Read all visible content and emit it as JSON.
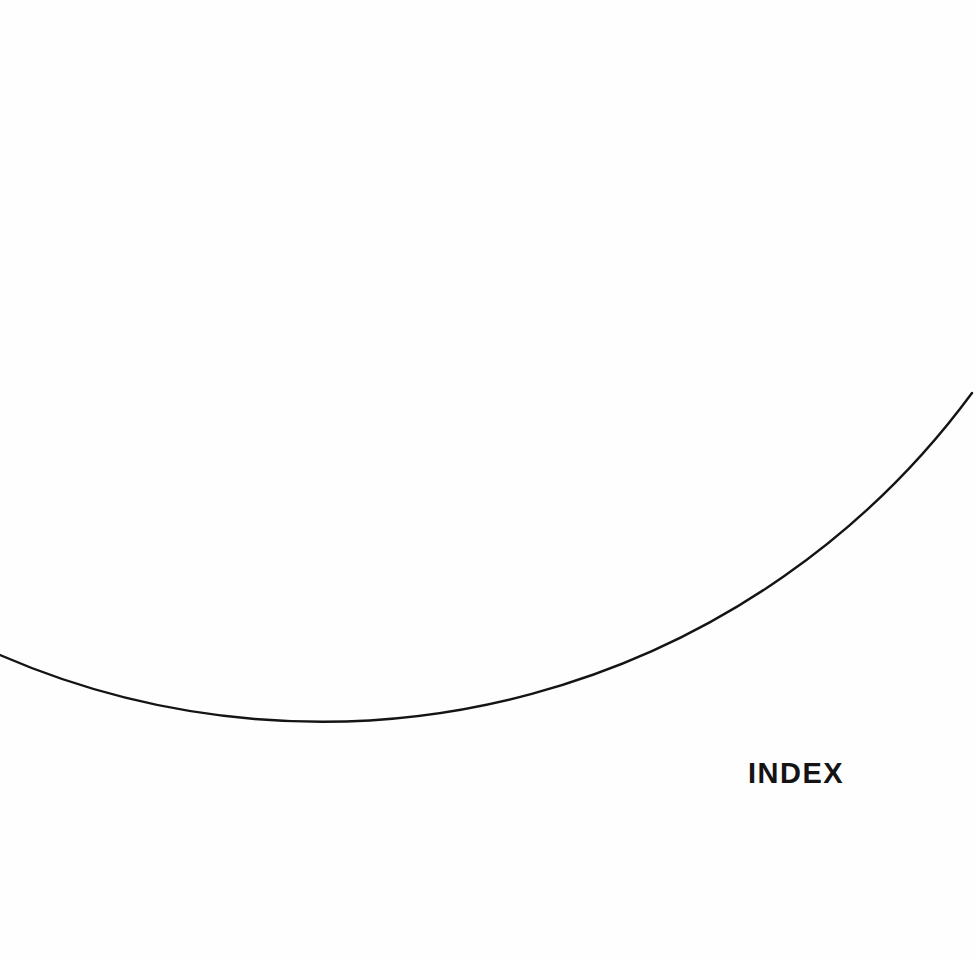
{
  "page": {
    "section_title": "INDEX",
    "background_color": "#fefefe",
    "ink_color": "#141414"
  },
  "decoration": {
    "type": "arc",
    "stroke_color": "#141414"
  }
}
